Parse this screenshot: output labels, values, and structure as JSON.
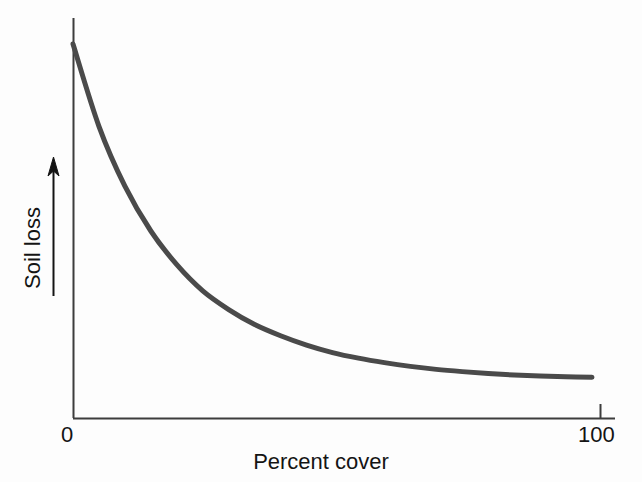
{
  "figure": {
    "background_color": "#fdfdfd",
    "axis_color": "#3d3d3d",
    "curve_color": "#4a4a4a",
    "text_color": "#141414"
  },
  "axes": {
    "x_tick_labels": [
      "0",
      "100"
    ],
    "x_title": "Percent cover",
    "y_title": "Soil loss",
    "y_arrow_icon": "up-arrow-icon"
  },
  "chart_data": {
    "type": "line",
    "title": "",
    "subtitle": "",
    "xlabel": "Percent cover",
    "ylabel": "Soil loss",
    "xlim": [
      0,
      100
    ],
    "ylim": [
      0,
      100
    ],
    "xticks": [
      0,
      100
    ],
    "xticklabels": [
      "0",
      "100"
    ],
    "yticks": [],
    "yticklabels": [],
    "grid": false,
    "legend": false,
    "legend_position": "none",
    "annotations": [
      "y-axis labelled with an upward arrow indicating increasing soil loss (no numeric scale)"
    ],
    "series": [
      {
        "name": "Soil loss",
        "x": [
          0,
          5,
          10,
          15,
          20,
          25,
          30,
          35,
          40,
          45,
          50,
          55,
          60,
          65,
          70,
          75,
          80,
          85,
          90,
          95,
          100
        ],
        "y": [
          100,
          78,
          62,
          50,
          41,
          34,
          29,
          25,
          22,
          19.5,
          17.5,
          16,
          14.8,
          13.8,
          13,
          12.4,
          11.9,
          11.5,
          11.2,
          11.0,
          10.9
        ]
      }
    ]
  }
}
